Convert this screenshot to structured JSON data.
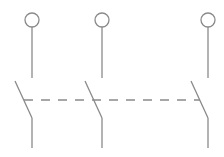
{
  "diagram": {
    "stroke_color": "#8a8a8a",
    "stroke_width": 1.3,
    "terminal_radius": 7,
    "poles": [
      {
        "id": "pole-1",
        "x": 32
      },
      {
        "id": "pole-2",
        "x": 102
      },
      {
        "id": "pole-3",
        "x": 208
      }
    ],
    "terminal_y": 20,
    "upper_lead_end_y": 78,
    "blade_start_offset_x": -17,
    "blade_start_y": 81,
    "blade_end_y": 118,
    "lower_lead_end_y": 148,
    "mechanical_link": {
      "y": 100,
      "x_start": 24,
      "x_end": 200,
      "dash": "9,8"
    }
  }
}
